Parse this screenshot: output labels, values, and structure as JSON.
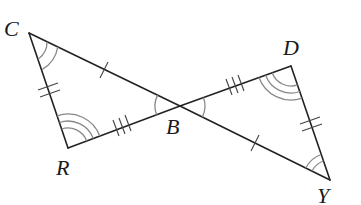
{
  "diagram": {
    "type": "congruent-triangles",
    "colors": {
      "edge": "#222222",
      "arc": "#888888",
      "tick": "#444444",
      "label": "#1a1a1a"
    },
    "vertices": [
      {
        "id": "C",
        "label": "C",
        "x": 29,
        "y": 33,
        "label_x": 4,
        "label_y": 36
      },
      {
        "id": "R",
        "label": "R",
        "x": 68,
        "y": 148,
        "label_x": 56,
        "label_y": 175
      },
      {
        "id": "B",
        "label": "B",
        "x": 180,
        "y": 106,
        "label_x": 166,
        "label_y": 134
      },
      {
        "id": "D",
        "label": "D",
        "x": 291,
        "y": 66,
        "label_x": 283,
        "label_y": 55
      },
      {
        "id": "Y",
        "label": "Y",
        "x": 330,
        "y": 180,
        "label_x": 317,
        "label_y": 203
      }
    ],
    "edges": [
      {
        "from": "C",
        "to": "R",
        "tick_marks": 2
      },
      {
        "from": "R",
        "to": "B",
        "tick_marks": 3
      },
      {
        "from": "C",
        "to": "B",
        "tick_marks": 1
      },
      {
        "from": "B",
        "to": "D",
        "tick_marks": 3
      },
      {
        "from": "D",
        "to": "Y",
        "tick_marks": 2
      },
      {
        "from": "B",
        "to": "Y",
        "tick_marks": 1
      }
    ],
    "angle_marks": [
      {
        "vertex": "C",
        "arcs": 2
      },
      {
        "vertex": "R",
        "arcs": 3
      },
      {
        "vertex": "B",
        "arcs": 1,
        "note": "angle CBR"
      },
      {
        "vertex": "B",
        "arcs": 1,
        "note": "angle DBY"
      },
      {
        "vertex": "D",
        "arcs": 3
      },
      {
        "vertex": "Y",
        "arcs": 2
      }
    ]
  }
}
